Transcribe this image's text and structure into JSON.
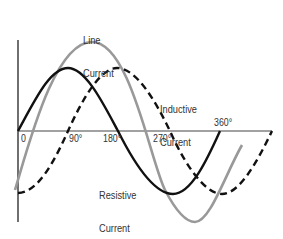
{
  "diagram": {
    "type": "sine-wave phase diagram",
    "axis": {
      "tick_labels": [
        "0",
        "90°",
        "180°",
        "270°",
        "360°"
      ]
    },
    "curves": [
      {
        "name": "Line Current",
        "label_line1": "Line",
        "label_line2": "Current",
        "style": "solid",
        "color": "#999999"
      },
      {
        "name": "Inductive Current",
        "label_line1": "Inductive",
        "label_line2": "Current",
        "style": "dashed",
        "color": "#111111"
      },
      {
        "name": "Resistive Current",
        "label_line1": "Resistive",
        "label_line2": "Current",
        "style": "solid",
        "color": "#111111"
      }
    ]
  }
}
